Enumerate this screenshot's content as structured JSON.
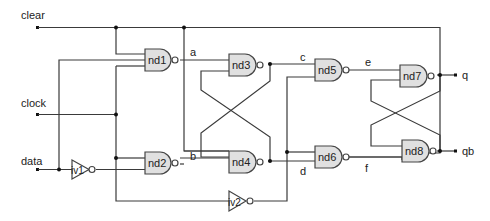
{
  "diagram": {
    "type": "logic-circuit",
    "inputs": {
      "clear": "clear",
      "clock": "clock",
      "data": "data"
    },
    "outputs": {
      "q": "q",
      "qb": "qb"
    },
    "gates": {
      "nd1": "nd1",
      "nd2": "nd2",
      "nd3": "nd3",
      "nd4": "nd4",
      "nd5": "nd5",
      "nd6": "nd6",
      "nd7": "nd7",
      "nd8": "nd8",
      "iv1": "iv1",
      "iv2": "iv2"
    },
    "nets": {
      "a": "a",
      "b": "b",
      "c": "c",
      "d": "d",
      "e": "e",
      "f": "f"
    },
    "colors": {
      "gate_fill": "#e0e0e0",
      "wire": "#3a3a3a",
      "background": "#ffffff"
    }
  }
}
